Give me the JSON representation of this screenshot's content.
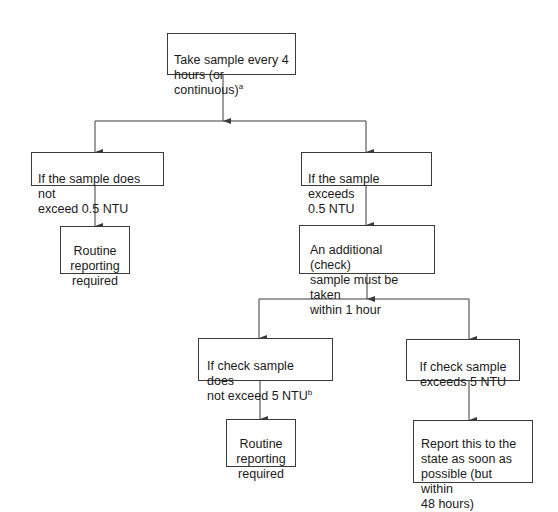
{
  "diagram": {
    "type": "flowchart",
    "nodes": {
      "start": {
        "text": "Take sample every 4\nhours (or continuous)",
        "footnote": "a"
      },
      "not_exceed_05": {
        "text": "If the sample does not\nexceed 0.5 NTU"
      },
      "exceeds_05": {
        "text": "If the sample exceeds\n0.5 NTU"
      },
      "routine_1": {
        "text": "Routine\nreporting\nrequired"
      },
      "check_sample": {
        "text": "An additional (check)\nsample must be taken\nwithin 1 hour"
      },
      "check_not_exceed_5": {
        "text": "If check sample does\nnot exceed 5 NTU",
        "footnote": "b"
      },
      "check_exceeds_5": {
        "text": "If check sample\nexceeds 5 NTU"
      },
      "routine_2": {
        "text": "Routine\nreporting\nrequired"
      },
      "report_state": {
        "text": "Report this to the\nstate as soon as\npossible (but within\n48 hours)"
      }
    },
    "edges": [
      {
        "from": "start",
        "to": "not_exceed_05"
      },
      {
        "from": "start",
        "to": "exceeds_05"
      },
      {
        "from": "not_exceed_05",
        "to": "routine_1"
      },
      {
        "from": "exceeds_05",
        "to": "check_sample"
      },
      {
        "from": "check_sample",
        "to": "check_not_exceed_5"
      },
      {
        "from": "check_sample",
        "to": "check_exceeds_5"
      },
      {
        "from": "check_not_exceed_5",
        "to": "routine_2"
      },
      {
        "from": "check_exceeds_5",
        "to": "report_state"
      }
    ],
    "colors": {
      "line": "#3a3a3a",
      "box_border": "#3a3a3a",
      "text": "#1a1a1a",
      "background": "#ffffff"
    }
  }
}
